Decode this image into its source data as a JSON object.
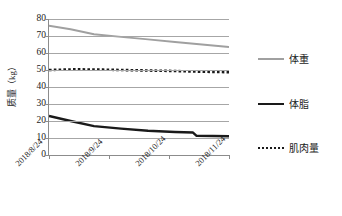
{
  "chart_data": {
    "type": "line",
    "title": "",
    "xlabel": "",
    "ylabel": "质量（kg）",
    "ylim": [
      0,
      80
    ],
    "ytick_labels": [
      "80",
      "70",
      "60",
      "50",
      "40",
      "30",
      "20",
      "10",
      "0"
    ],
    "ytick_values": [
      80,
      70,
      60,
      50,
      40,
      30,
      20,
      10,
      0
    ],
    "grid": true,
    "legend_position": "right",
    "x": [
      "2018/8/24",
      "2018/9/24",
      "2018/10/24",
      "2018/11/24"
    ],
    "xtick_labels": [
      "2018/8/24",
      "2018/9/24",
      "2018/10/24",
      "2018/11/24"
    ],
    "series": [
      {
        "name": "体重",
        "color": "#a0a0a0",
        "style": "solid",
        "x": [
          0,
          0.12,
          0.25,
          0.4,
          0.55,
          0.7,
          0.85,
          1.0
        ],
        "values": [
          76.0,
          74.0,
          71.0,
          69.5,
          68.0,
          66.5,
          65.0,
          63.5
        ]
      },
      {
        "name": "体脂",
        "color": "#1a1a1a",
        "style": "solid",
        "x": [
          0,
          0.12,
          0.25,
          0.4,
          0.55,
          0.7,
          0.8,
          0.82,
          1.0
        ],
        "values": [
          23.0,
          20.0,
          17.0,
          15.5,
          14.3,
          13.5,
          13.2,
          11.3,
          11.0
        ]
      },
      {
        "name": "肌肉量",
        "color": "#1a1a1a",
        "style": "dotted",
        "x": [
          0,
          0.15,
          0.3,
          0.5,
          0.7,
          0.85,
          1.0
        ],
        "values": [
          50.0,
          50.4,
          50.2,
          49.8,
          49.4,
          49.0,
          48.7
        ]
      }
    ]
  },
  "legend": {
    "items": [
      {
        "label": "体重",
        "swatch": "solid-gray"
      },
      {
        "label": "体脂",
        "swatch": "solid-black"
      },
      {
        "label": "肌肉量",
        "swatch": "dotted"
      }
    ]
  }
}
